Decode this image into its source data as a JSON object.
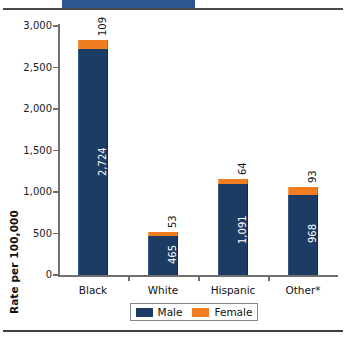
{
  "decor": {
    "top_tab": "title-banner-fragment",
    "top_rule": "horizontal-rule",
    "bottom_rule": "horizontal-rule"
  },
  "chart_data": {
    "type": "bar",
    "subtype": "stacked-column",
    "title": "",
    "xlabel": "",
    "ylabel": "Rate per 100,000",
    "categories": [
      "Black",
      "White",
      "Hispanic",
      "Other*"
    ],
    "series": [
      {
        "name": "Male",
        "color": "#1c3c64",
        "values": [
          2724,
          465,
          1091,
          968
        ],
        "labels": [
          "2,724",
          "465",
          "1,091",
          "968"
        ]
      },
      {
        "name": "Female",
        "color": "#f07d20",
        "values": [
          109,
          53,
          64,
          93
        ],
        "labels": [
          "109",
          "53",
          "64",
          "93"
        ]
      }
    ],
    "totals": [
      2833,
      518,
      1155,
      1061
    ],
    "ylim": [
      0,
      3000
    ],
    "yticks": [
      0,
      500,
      1000,
      1500,
      2000,
      2500,
      3000
    ],
    "ytick_labels": [
      "0",
      "500",
      "1,000",
      "1,500",
      "2,000",
      "2,500",
      "3,000"
    ],
    "grid": false,
    "legend_position": "bottom",
    "label_orientation": "vertical"
  },
  "legend": {
    "items": [
      {
        "label": "Male",
        "swatch": "navy-swatch"
      },
      {
        "label": "Female",
        "swatch": "orange-swatch"
      }
    ]
  },
  "colors": {
    "male": "#1c3c64",
    "female": "#f07d20",
    "axis": "#6f6f6f",
    "banner": "#2d5690",
    "rule": "#4a4a4a"
  }
}
